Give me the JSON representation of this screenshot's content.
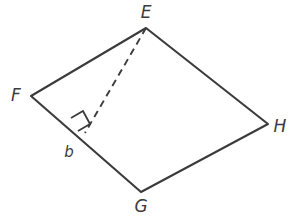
{
  "figure": {
    "kind": "quadrilateral-with-altitude",
    "stroke_color": "#3b3b3b",
    "background_color": "#ffffff",
    "labels": {
      "vertex_e": "E",
      "vertex_f": "F",
      "vertex_g": "G",
      "vertex_h": "H",
      "height_segment": "b"
    },
    "label_positions": {
      "vertex_e": {
        "x": 146,
        "y": 18
      },
      "vertex_f": {
        "x": 16,
        "y": 101
      },
      "vertex_g": {
        "x": 141,
        "y": 212
      },
      "vertex_h": {
        "x": 280,
        "y": 132
      },
      "height_segment": {
        "x": 69,
        "y": 157
      }
    },
    "vertices": {
      "E": {
        "x": 146,
        "y": 28
      },
      "F": {
        "x": 31,
        "y": 96
      },
      "G": {
        "x": 141,
        "y": 192
      },
      "H": {
        "x": 268,
        "y": 124
      }
    },
    "altitude_foot": {
      "x": 85,
      "y": 133
    },
    "outline_path": "M 146 28 L 31 96 L 141 192 L 268 124 Z",
    "altitude_path": "M 146 28 L 85 133",
    "right_angle_path": "M 71 118 L 83 111 L 90 124 L 78 131",
    "right_angle_size": 14
  }
}
